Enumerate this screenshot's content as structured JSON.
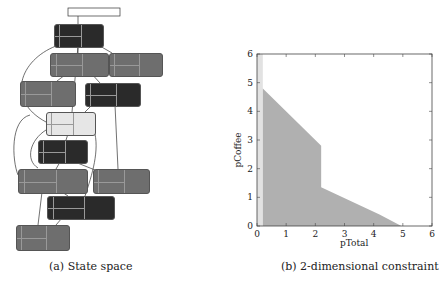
{
  "captions": {
    "a": "(a) State space",
    "b": "(b) 2-dimensional constraint"
  },
  "state_space": {
    "nodes": [
      {
        "id": "n0",
        "shade": "dark",
        "x": 54,
        "y": 24,
        "w": 48,
        "h": 22
      },
      {
        "id": "n1",
        "shade": "mid",
        "x": 50,
        "y": 53,
        "w": 57,
        "h": 22
      },
      {
        "id": "n2",
        "shade": "mid",
        "x": 109,
        "y": 53,
        "w": 52,
        "h": 22
      },
      {
        "id": "n3",
        "shade": "mid",
        "x": 20,
        "y": 81,
        "w": 54,
        "h": 24
      },
      {
        "id": "n4",
        "shade": "dark",
        "x": 85,
        "y": 83,
        "w": 54,
        "h": 22
      },
      {
        "id": "n5",
        "shade": "light",
        "x": 46,
        "y": 112,
        "w": 48,
        "h": 22
      },
      {
        "id": "n6",
        "shade": "dark",
        "x": 38,
        "y": 140,
        "w": 48,
        "h": 22
      },
      {
        "id": "n7",
        "shade": "mid",
        "x": 18,
        "y": 169,
        "w": 68,
        "h": 23
      },
      {
        "id": "n8",
        "shade": "mid",
        "x": 93,
        "y": 169,
        "w": 55,
        "h": 23
      },
      {
        "id": "n9",
        "shade": "dark",
        "x": 47,
        "y": 196,
        "w": 66,
        "h": 22
      },
      {
        "id": "n10",
        "shade": "mid",
        "x": 16,
        "y": 225,
        "w": 52,
        "h": 24
      }
    ]
  },
  "chart_data": {
    "type": "area",
    "title": "",
    "xlabel": "pTotal",
    "ylabel": "pCoffee",
    "xlim": [
      0,
      6
    ],
    "ylim": [
      0,
      6
    ],
    "xticks": [
      "0",
      "1",
      "2",
      "3",
      "4",
      "5",
      "6"
    ],
    "yticks": [
      "0",
      "1",
      "2",
      "3",
      "4",
      "5",
      "6"
    ],
    "grid": false,
    "series": [
      {
        "name": "feasible region",
        "polygon": [
          [
            0.2,
            0
          ],
          [
            0.2,
            4.8
          ],
          [
            2.2,
            2.8
          ],
          [
            2.2,
            1.35
          ],
          [
            4.2,
            0.4
          ],
          [
            4.95,
            0
          ]
        ],
        "color": "#b0b0b0"
      },
      {
        "name": "band",
        "polygon": [
          [
            0,
            0
          ],
          [
            0,
            6
          ],
          [
            0.2,
            6
          ],
          [
            0.2,
            0
          ]
        ],
        "color": "#e2e2e2"
      }
    ]
  }
}
